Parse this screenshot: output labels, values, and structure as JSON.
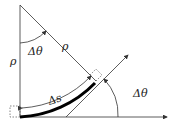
{
  "diagram": {
    "title": "",
    "labels": {
      "rho_left": "ρ",
      "rho_diag": "ρ",
      "dtheta_top": "Δθ",
      "dtheta_right": "Δθ",
      "ds": "Δs"
    },
    "colors": {
      "line": "#333333",
      "thick_arc": "#000000",
      "dashed": "#555555"
    }
  }
}
